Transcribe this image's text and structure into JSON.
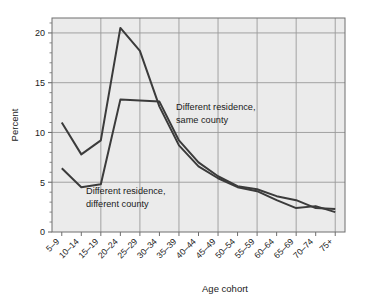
{
  "chart_data": {
    "type": "line",
    "title": "",
    "xlabel": "Age cohort",
    "ylabel": "Percent",
    "categories": [
      "5–9",
      "10–14",
      "15–19",
      "20–24",
      "25–29",
      "30–34",
      "35–39",
      "40–44",
      "45–49",
      "50–54",
      "55–59",
      "60–64",
      "65–69",
      "70–74",
      "75+"
    ],
    "series": [
      {
        "name": "Different residence, same county",
        "values": [
          11.0,
          7.8,
          9.2,
          20.5,
          18.2,
          12.6,
          8.7,
          6.6,
          5.4,
          4.5,
          4.1,
          3.2,
          2.4,
          2.6,
          2.0
        ]
      },
      {
        "name": "Different residence, different county",
        "values": [
          6.4,
          4.5,
          4.8,
          13.3,
          13.2,
          13.1,
          9.2,
          7.0,
          5.6,
          4.6,
          4.3,
          3.6,
          3.2,
          2.4,
          2.3
        ]
      }
    ],
    "ylim": [
      0,
      21.5
    ],
    "yticks": [
      0,
      5,
      10,
      15,
      20
    ],
    "ytick_labels": [
      "0",
      "5",
      "10",
      "15",
      "20"
    ],
    "grid": true,
    "grid_axes": "both",
    "legend_position": "inline-annotations",
    "annotations": [
      {
        "id": "annotation-same-county",
        "line1": "Different residence,",
        "line2": "same county"
      },
      {
        "id": "annotation-different-county",
        "line1": "Different residence,",
        "line2": "different county"
      }
    ],
    "colors": {
      "line": "#3b3b3b",
      "plot_background": "#ebebeb",
      "grid": "#9a9a9a",
      "axis": "#6e6e6e",
      "text": "#1a1a1a",
      "figure_background": "#ffffff"
    }
  }
}
